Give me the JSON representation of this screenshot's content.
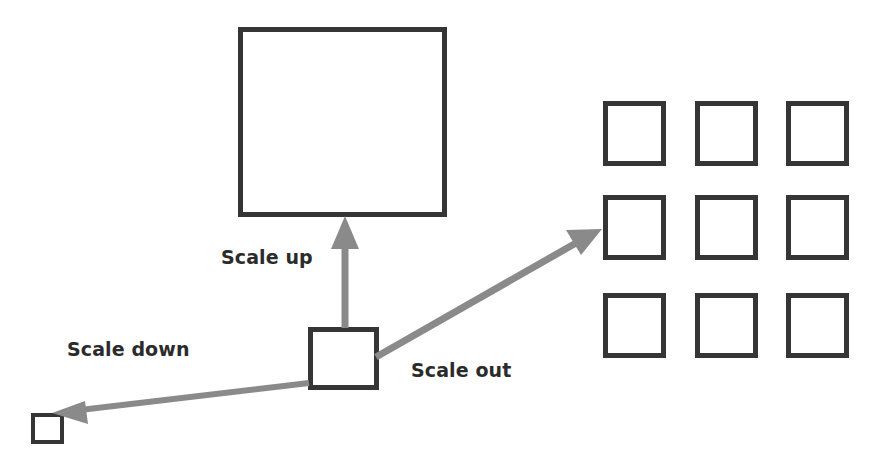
{
  "diagram": {
    "background_color": "#ffffff",
    "shape_stroke_color": "#353535",
    "arrow_color": "#8a8a8a",
    "label_color": "#2b2b2b",
    "labels": {
      "scale_up": "Scale up",
      "scale_down": "Scale down",
      "scale_out": "Scale out"
    },
    "shapes": {
      "large_square": "large-square",
      "center_square": "center-square",
      "small_square": "small-square",
      "grid": {
        "rows": 3,
        "columns": 3,
        "cells": [
          "grid-cell-1",
          "grid-cell-2",
          "grid-cell-3",
          "grid-cell-4",
          "grid-cell-5",
          "grid-cell-6",
          "grid-cell-7",
          "grid-cell-8",
          "grid-cell-9"
        ]
      }
    },
    "arrows": [
      {
        "name": "scale-up-arrow",
        "from": "center-square",
        "to": "large-square",
        "direction": "up"
      },
      {
        "name": "scale-out-arrow",
        "from": "center-square",
        "to": "grid",
        "direction": "up-right"
      },
      {
        "name": "scale-down-arrow",
        "from": "center-square",
        "to": "small-square",
        "direction": "down-left"
      }
    ]
  }
}
